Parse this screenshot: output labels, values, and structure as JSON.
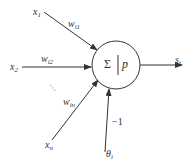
{
  "diagram": {
    "type": "artificial-neuron-model",
    "node": {
      "sum_symbol": "Σ",
      "activation_symbol": "p"
    },
    "inputs": [
      {
        "label": "x",
        "sub": "1",
        "weight": "w",
        "weight_sub": "i1"
      },
      {
        "label": "x",
        "sub": "2",
        "weight": "w",
        "weight_sub": "i2"
      },
      {
        "label": "x",
        "sub": "n",
        "weight": "w",
        "weight_sub": "in"
      }
    ],
    "ellipsis": "⋮",
    "threshold": {
      "label": "θ",
      "sub": "i",
      "weight": "−1"
    },
    "output": {
      "label": "s",
      "sub": "i"
    },
    "colors": {
      "line": "#333333",
      "background": "#ffffff"
    }
  }
}
